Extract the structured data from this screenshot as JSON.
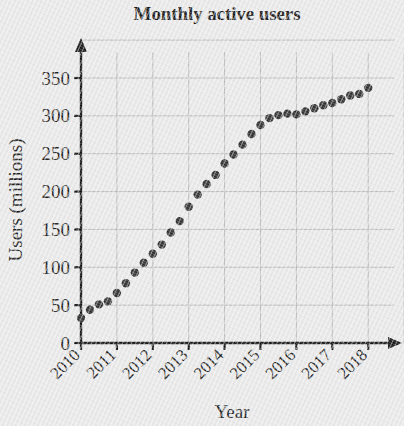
{
  "chart_data": {
    "type": "scatter",
    "title": "Monthly active users",
    "xlabel": "Year",
    "ylabel": "Users (millions)",
    "xlim": [
      2010,
      2018.6
    ],
    "ylim": [
      0,
      370
    ],
    "grid": true,
    "legend": false,
    "x_tick_labels": [
      "2010",
      "2011",
      "2012",
      "2013",
      "2014",
      "2015",
      "2016",
      "2017",
      "2018"
    ],
    "x_ticks": [
      2010,
      2011,
      2012,
      2013,
      2014,
      2015,
      2016,
      2017,
      2018
    ],
    "y_tick_labels": [
      "0",
      "50",
      "100",
      "150",
      "200",
      "250",
      "300",
      "350"
    ],
    "y_ticks": [
      0,
      50,
      100,
      150,
      200,
      250,
      300,
      350
    ],
    "marker": "filled-circle",
    "marker_color": "#2a2a2a",
    "series": [
      {
        "name": "Monthly active users",
        "x": [
          2010.0,
          2010.25,
          2010.5,
          2010.75,
          2011.0,
          2011.25,
          2011.5,
          2011.75,
          2012.0,
          2012.25,
          2012.5,
          2012.75,
          2013.0,
          2013.25,
          2013.5,
          2013.75,
          2014.0,
          2014.25,
          2014.5,
          2014.75,
          2015.0,
          2015.25,
          2015.5,
          2015.75,
          2016.0,
          2016.25,
          2016.5,
          2016.75,
          2017.0,
          2017.25,
          2017.5,
          2017.75,
          2018.0
        ],
        "values": [
          33,
          44,
          51,
          55,
          66,
          79,
          93,
          106,
          118,
          130,
          146,
          161,
          180,
          196,
          210,
          222,
          237,
          249,
          262,
          276,
          288,
          297,
          301,
          303,
          302,
          306,
          310,
          314,
          317,
          322,
          327,
          329,
          337
        ]
      }
    ]
  },
  "colors": {
    "background": "#e9e9e9",
    "axis": "#101010",
    "grid": "#b9b9b9",
    "marker": "#2a2a2a",
    "text": "#131313"
  }
}
